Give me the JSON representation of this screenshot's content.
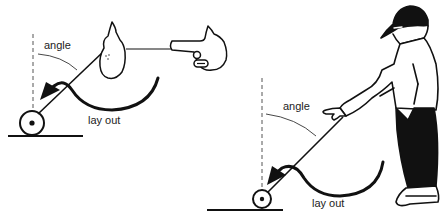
{
  "diagram": {
    "panels": [
      {
        "id": "left",
        "labels": {
          "angle": "angle",
          "lay_out": "lay out"
        }
      },
      {
        "id": "right",
        "labels": {
          "angle": "angle",
          "lay_out": "lay out"
        }
      }
    ],
    "colors": {
      "ink": "#111111",
      "dashed_line": "#555555",
      "background": "#ffffff"
    }
  }
}
